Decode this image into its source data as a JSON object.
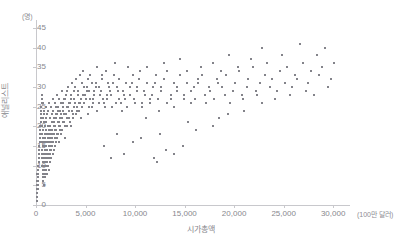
{
  "chart_data": {
    "type": "scatter",
    "title": "",
    "xlabel": "시가총액",
    "ylabel": "애널리스트",
    "x_unit": "(100만 달러)",
    "y_unit": "(명)",
    "xlim": [
      0,
      31500
    ],
    "ylim": [
      0,
      47
    ],
    "grid": false,
    "legend": null,
    "marker": {
      "shape": "square",
      "size_px": 2,
      "color": "#83838a"
    },
    "axis_color": "#c8c8cc",
    "tick_label_color": "#87878d",
    "xticks": [
      0,
      5000,
      10000,
      15000,
      20000,
      25000,
      30000
    ],
    "xtick_labels": [
      "0",
      "5,000",
      "10,000",
      "15,000",
      "20,000",
      "25,000",
      "30,000"
    ],
    "yticks": [
      0,
      5,
      10,
      15,
      20,
      25,
      30,
      35,
      40,
      45
    ],
    "ytick_labels": [
      "0",
      "5",
      "10",
      "15",
      "20",
      "25",
      "30",
      "35",
      "40",
      "45"
    ],
    "points": [
      [
        60,
        1
      ],
      [
        80,
        2
      ],
      [
        70,
        3
      ],
      [
        90,
        4
      ],
      [
        110,
        2
      ],
      [
        130,
        5
      ],
      [
        150,
        3
      ],
      [
        120,
        6
      ],
      [
        170,
        4
      ],
      [
        200,
        7
      ],
      [
        140,
        8
      ],
      [
        180,
        6
      ],
      [
        220,
        9
      ],
      [
        160,
        5
      ],
      [
        240,
        10
      ],
      [
        190,
        7
      ],
      [
        260,
        11
      ],
      [
        210,
        8
      ],
      [
        280,
        12
      ],
      [
        230,
        9
      ],
      [
        300,
        13
      ],
      [
        250,
        10
      ],
      [
        320,
        14
      ],
      [
        270,
        11
      ],
      [
        340,
        15
      ],
      [
        290,
        12
      ],
      [
        360,
        16
      ],
      [
        310,
        13
      ],
      [
        380,
        17
      ],
      [
        330,
        14
      ],
      [
        400,
        18
      ],
      [
        350,
        15
      ],
      [
        420,
        19
      ],
      [
        370,
        16
      ],
      [
        440,
        20
      ],
      [
        390,
        17
      ],
      [
        460,
        21
      ],
      [
        410,
        18
      ],
      [
        480,
        22
      ],
      [
        430,
        19
      ],
      [
        500,
        23
      ],
      [
        450,
        20
      ],
      [
        520,
        24
      ],
      [
        470,
        21
      ],
      [
        540,
        25
      ],
      [
        490,
        22
      ],
      [
        560,
        26
      ],
      [
        510,
        23
      ],
      [
        580,
        27
      ],
      [
        530,
        24
      ],
      [
        600,
        28
      ],
      [
        550,
        25
      ],
      [
        620,
        20
      ],
      [
        570,
        16
      ],
      [
        640,
        18
      ],
      [
        590,
        14
      ],
      [
        660,
        22
      ],
      [
        610,
        12
      ],
      [
        680,
        15
      ],
      [
        630,
        10
      ],
      [
        700,
        26
      ],
      [
        650,
        13
      ],
      [
        720,
        17
      ],
      [
        670,
        11
      ],
      [
        740,
        19
      ],
      [
        690,
        9
      ],
      [
        760,
        21
      ],
      [
        710,
        8
      ],
      [
        780,
        23
      ],
      [
        730,
        7
      ],
      [
        800,
        24
      ],
      [
        750,
        6
      ],
      [
        820,
        13
      ],
      [
        770,
        5
      ],
      [
        840,
        16
      ],
      [
        790,
        12
      ],
      [
        860,
        18
      ],
      [
        810,
        10
      ],
      [
        880,
        14
      ],
      [
        830,
        9
      ],
      [
        900,
        20
      ],
      [
        850,
        11
      ],
      [
        920,
        15
      ],
      [
        870,
        8
      ],
      [
        940,
        17
      ],
      [
        890,
        13
      ],
      [
        960,
        19
      ],
      [
        910,
        7
      ],
      [
        980,
        22
      ],
      [
        930,
        12
      ],
      [
        1000,
        25
      ],
      [
        950,
        14
      ],
      [
        1030,
        16
      ],
      [
        970,
        10
      ],
      [
        1060,
        21
      ],
      [
        990,
        11
      ],
      [
        1090,
        18
      ],
      [
        1010,
        9
      ],
      [
        1120,
        23
      ],
      [
        1040,
        15
      ],
      [
        1150,
        13
      ],
      [
        1070,
        12
      ],
      [
        1180,
        20
      ],
      [
        1100,
        8
      ],
      [
        1210,
        17
      ],
      [
        1130,
        14
      ],
      [
        1240,
        24
      ],
      [
        1160,
        11
      ],
      [
        1270,
        19
      ],
      [
        1190,
        16
      ],
      [
        1300,
        15
      ],
      [
        1220,
        10
      ],
      [
        1330,
        26
      ],
      [
        1250,
        13
      ],
      [
        1360,
        18
      ],
      [
        1280,
        12
      ],
      [
        1390,
        22
      ],
      [
        1310,
        17
      ],
      [
        1420,
        14
      ],
      [
        1340,
        9
      ],
      [
        1450,
        20
      ],
      [
        1370,
        16
      ],
      [
        1480,
        25
      ],
      [
        1400,
        11
      ],
      [
        1510,
        19
      ],
      [
        1430,
        15
      ],
      [
        1540,
        17
      ],
      [
        1460,
        13
      ],
      [
        1570,
        23
      ],
      [
        1490,
        18
      ],
      [
        1600,
        16
      ],
      [
        1520,
        12
      ],
      [
        1640,
        21
      ],
      [
        1550,
        14
      ],
      [
        1680,
        27
      ],
      [
        1580,
        19
      ],
      [
        1720,
        18
      ],
      [
        1610,
        15
      ],
      [
        1760,
        24
      ],
      [
        1650,
        17
      ],
      [
        1800,
        20
      ],
      [
        1690,
        13
      ],
      [
        1840,
        22
      ],
      [
        1730,
        16
      ],
      [
        1880,
        19
      ],
      [
        1770,
        21
      ],
      [
        1920,
        26
      ],
      [
        1810,
        14
      ],
      [
        1960,
        17
      ],
      [
        1850,
        18
      ],
      [
        2000,
        23
      ],
      [
        1890,
        15
      ],
      [
        2050,
        25
      ],
      [
        1930,
        20
      ],
      [
        2100,
        18
      ],
      [
        1970,
        16
      ],
      [
        2150,
        28
      ],
      [
        2010,
        22
      ],
      [
        2200,
        21
      ],
      [
        2060,
        19
      ],
      [
        2250,
        24
      ],
      [
        2110,
        17
      ],
      [
        2300,
        20
      ],
      [
        2160,
        23
      ],
      [
        2350,
        27
      ],
      [
        2210,
        18
      ],
      [
        2400,
        22
      ],
      [
        2260,
        25
      ],
      [
        2450,
        19
      ],
      [
        2310,
        21
      ],
      [
        2500,
        26
      ],
      [
        2360,
        16
      ],
      [
        2560,
        23
      ],
      [
        2410,
        20
      ],
      [
        2620,
        29
      ],
      [
        2470,
        24
      ],
      [
        2680,
        21
      ],
      [
        2520,
        18
      ],
      [
        2740,
        25
      ],
      [
        2580,
        22
      ],
      [
        2800,
        27
      ],
      [
        2640,
        19
      ],
      [
        2870,
        23
      ],
      [
        2700,
        26
      ],
      [
        2940,
        20
      ],
      [
        2760,
        24
      ],
      [
        3010,
        28
      ],
      [
        2830,
        21
      ],
      [
        3080,
        25
      ],
      [
        2900,
        17
      ],
      [
        3150,
        22
      ],
      [
        2970,
        27
      ],
      [
        3220,
        30
      ],
      [
        3040,
        23
      ],
      [
        3300,
        26
      ],
      [
        3110,
        20
      ],
      [
        3380,
        24
      ],
      [
        3180,
        29
      ],
      [
        3460,
        21
      ],
      [
        3250,
        25
      ],
      [
        3540,
        27
      ],
      [
        3330,
        22
      ],
      [
        3620,
        31
      ],
      [
        3410,
        26
      ],
      [
        3700,
        23
      ],
      [
        3490,
        28
      ],
      [
        3790,
        25
      ],
      [
        3570,
        20
      ],
      [
        3880,
        29
      ],
      [
        3660,
        24
      ],
      [
        3970,
        26
      ],
      [
        3750,
        22
      ],
      [
        4060,
        32
      ],
      [
        3840,
        27
      ],
      [
        4150,
        24
      ],
      [
        3930,
        30
      ],
      [
        4250,
        28
      ],
      [
        4020,
        23
      ],
      [
        4350,
        26
      ],
      [
        4120,
        25
      ],
      [
        4450,
        33
      ],
      [
        4220,
        29
      ],
      [
        4560,
        27
      ],
      [
        4320,
        24
      ],
      [
        4670,
        31
      ],
      [
        4420,
        26
      ],
      [
        4780,
        28
      ],
      [
        4530,
        22
      ],
      [
        4890,
        30
      ],
      [
        4640,
        25
      ],
      [
        5000,
        27
      ],
      [
        4750,
        34
      ],
      [
        5120,
        29
      ],
      [
        4860,
        26
      ],
      [
        5240,
        32
      ],
      [
        4980,
        28
      ],
      [
        5360,
        25
      ],
      [
        5100,
        30
      ],
      [
        5490,
        27
      ],
      [
        5220,
        23
      ],
      [
        5620,
        31
      ],
      [
        5350,
        29
      ],
      [
        5750,
        26
      ],
      [
        5480,
        33
      ],
      [
        5890,
        28
      ],
      [
        5610,
        25
      ],
      [
        6030,
        30
      ],
      [
        5750,
        27
      ],
      [
        6170,
        35
      ],
      [
        5900,
        29
      ],
      [
        6320,
        26
      ],
      [
        6050,
        31
      ],
      [
        6470,
        28
      ],
      [
        6200,
        24
      ],
      [
        6630,
        33
      ],
      [
        6360,
        30
      ],
      [
        6790,
        27
      ],
      [
        6520,
        29
      ],
      [
        6950,
        25
      ],
      [
        6680,
        32
      ],
      [
        7120,
        28
      ],
      [
        6850,
        26
      ],
      [
        7290,
        31
      ],
      [
        7020,
        34
      ],
      [
        7470,
        29
      ],
      [
        7190,
        27
      ],
      [
        7650,
        25
      ],
      [
        7370,
        30
      ],
      [
        7840,
        33
      ],
      [
        7550,
        28
      ],
      [
        8030,
        26
      ],
      [
        7740,
        31
      ],
      [
        8230,
        29
      ],
      [
        7930,
        36
      ],
      [
        8430,
        27
      ],
      [
        8130,
        30
      ],
      [
        8640,
        24
      ],
      [
        8340,
        32
      ],
      [
        8850,
        28
      ],
      [
        8550,
        26
      ],
      [
        9070,
        31
      ],
      [
        8770,
        29
      ],
      [
        9290,
        35
      ],
      [
        8990,
        27
      ],
      [
        9520,
        30
      ],
      [
        9210,
        25
      ],
      [
        9750,
        33
      ],
      [
        9440,
        28
      ],
      [
        9990,
        26
      ],
      [
        9680,
        31
      ],
      [
        10230,
        29
      ],
      [
        9920,
        27
      ],
      [
        10480,
        34
      ],
      [
        10170,
        30
      ],
      [
        10730,
        26
      ],
      [
        10420,
        32
      ],
      [
        10990,
        28
      ],
      [
        10680,
        25
      ],
      [
        11250,
        31
      ],
      [
        10940,
        29
      ],
      [
        11520,
        27
      ],
      [
        11210,
        35
      ],
      [
        11800,
        30
      ],
      [
        11480,
        26
      ],
      [
        12080,
        33
      ],
      [
        11760,
        28
      ],
      [
        12370,
        24
      ],
      [
        12050,
        31
      ],
      [
        12660,
        29
      ],
      [
        12340,
        27
      ],
      [
        12960,
        36
      ],
      [
        12640,
        30
      ],
      [
        13270,
        26
      ],
      [
        12950,
        32
      ],
      [
        13580,
        28
      ],
      [
        13260,
        34
      ],
      [
        13900,
        31
      ],
      [
        13580,
        27
      ],
      [
        14230,
        29
      ],
      [
        13910,
        25
      ],
      [
        14560,
        33
      ],
      [
        14240,
        30
      ],
      [
        14900,
        27
      ],
      [
        14580,
        37
      ],
      [
        15250,
        31
      ],
      [
        14930,
        28
      ],
      [
        15600,
        26
      ],
      [
        15280,
        34
      ],
      [
        15960,
        30
      ],
      [
        15640,
        29
      ],
      [
        16330,
        32
      ],
      [
        16010,
        27
      ],
      [
        16700,
        35
      ],
      [
        16380,
        31
      ],
      [
        17080,
        28
      ],
      [
        16760,
        33
      ],
      [
        17470,
        30
      ],
      [
        17150,
        26
      ],
      [
        17860,
        36
      ],
      [
        17540,
        29
      ],
      [
        18260,
        32
      ],
      [
        17940,
        27
      ],
      [
        18670,
        34
      ],
      [
        18350,
        31
      ],
      [
        19080,
        28
      ],
      [
        18760,
        30
      ],
      [
        19500,
        38
      ],
      [
        19180,
        33
      ],
      [
        19930,
        29
      ],
      [
        19610,
        26
      ],
      [
        20370,
        35
      ],
      [
        20050,
        31
      ],
      [
        20810,
        28
      ],
      [
        20490,
        34
      ],
      [
        21260,
        30
      ],
      [
        20940,
        27
      ],
      [
        21720,
        37
      ],
      [
        21400,
        32
      ],
      [
        22190,
        29
      ],
      [
        21870,
        35
      ],
      [
        22660,
        31
      ],
      [
        22340,
        28
      ],
      [
        23140,
        33
      ],
      [
        22820,
        40
      ],
      [
        23630,
        30
      ],
      [
        23310,
        36
      ],
      [
        24120,
        27
      ],
      [
        23800,
        32
      ],
      [
        24620,
        34
      ],
      [
        24300,
        29
      ],
      [
        25130,
        31
      ],
      [
        24810,
        38
      ],
      [
        25650,
        28
      ],
      [
        25330,
        35
      ],
      [
        26170,
        33
      ],
      [
        25850,
        30
      ],
      [
        26700,
        41
      ],
      [
        26380,
        32
      ],
      [
        27240,
        29
      ],
      [
        26920,
        36
      ],
      [
        27790,
        34
      ],
      [
        27470,
        31
      ],
      [
        28350,
        38
      ],
      [
        28030,
        28
      ],
      [
        28910,
        35
      ],
      [
        28590,
        33
      ],
      [
        29480,
        30
      ],
      [
        29160,
        40
      ],
      [
        30060,
        36
      ],
      [
        29740,
        32
      ],
      [
        11900,
        12
      ],
      [
        13100,
        14
      ],
      [
        9800,
        16
      ],
      [
        12500,
        18
      ],
      [
        8900,
        13
      ],
      [
        14800,
        15
      ],
      [
        10600,
        17
      ],
      [
        16200,
        19
      ],
      [
        7600,
        12
      ],
      [
        17900,
        20
      ],
      [
        11100,
        22
      ],
      [
        19400,
        23
      ],
      [
        6900,
        15
      ],
      [
        15300,
        21
      ],
      [
        21000,
        24
      ],
      [
        8200,
        18
      ],
      [
        22800,
        26
      ],
      [
        12200,
        11
      ],
      [
        13900,
        13
      ],
      [
        18500,
        22
      ]
    ]
  }
}
